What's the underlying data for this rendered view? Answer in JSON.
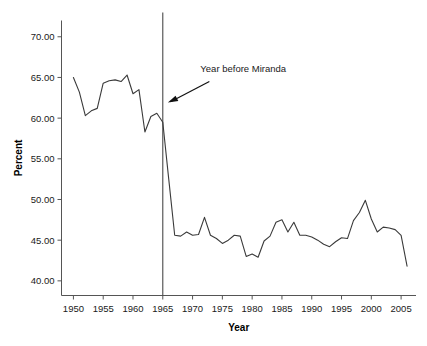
{
  "chart_data": {
    "type": "line",
    "title": "",
    "xlabel": "Year",
    "ylabel": "Percent",
    "xlim": [
      1948,
      2007.5
    ],
    "ylim": [
      38.2,
      72.0
    ],
    "grid": false,
    "legend": "none",
    "xticks": [
      1950,
      1955,
      1960,
      1965,
      1970,
      1975,
      1980,
      1985,
      1990,
      1995,
      2000,
      2005
    ],
    "xtick_labels": [
      "1950",
      "1955",
      "1960",
      "1965",
      "1970",
      "1975",
      "1980",
      "1985",
      "1990",
      "1995",
      "2000",
      "2005"
    ],
    "yticks": [
      40,
      45,
      50,
      55,
      60,
      65,
      70
    ],
    "ytick_labels": [
      "40.00",
      "45.00",
      "50.00",
      "55.00",
      "60.00",
      "65.00",
      "70.00"
    ],
    "x": [
      1950,
      1951,
      1952,
      1953,
      1954,
      1955,
      1956,
      1957,
      1958,
      1959,
      1960,
      1961,
      1962,
      1963,
      1964,
      1965,
      1966,
      1967,
      1968,
      1969,
      1970,
      1971,
      1972,
      1973,
      1974,
      1975,
      1976,
      1977,
      1978,
      1979,
      1980,
      1981,
      1982,
      1983,
      1984,
      1985,
      1986,
      1987,
      1988,
      1989,
      1990,
      1991,
      1992,
      1993,
      1994,
      1995,
      1996,
      1997,
      1998,
      1999,
      2000,
      2001,
      2002,
      2003,
      2004,
      2005,
      2006
    ],
    "values": [
      65.0,
      63.2,
      60.3,
      60.9,
      61.2,
      64.3,
      64.6,
      64.7,
      64.5,
      65.3,
      63.0,
      63.5,
      58.3,
      60.2,
      60.6,
      59.5,
      52.5,
      45.6,
      45.5,
      46.0,
      45.6,
      45.7,
      47.8,
      45.6,
      45.2,
      44.6,
      45.0,
      45.6,
      45.5,
      43.0,
      43.3,
      42.9,
      44.9,
      45.5,
      47.2,
      47.5,
      46.0,
      47.2,
      45.6,
      45.6,
      45.4,
      45.0,
      44.5,
      44.2,
      44.8,
      45.3,
      45.2,
      47.4,
      48.4,
      49.9,
      47.6,
      46.0,
      46.6,
      46.5,
      46.3,
      45.6,
      41.8
    ],
    "series_name": "Percent",
    "reference_line": {
      "x": 1965,
      "label": "Year before Miranda",
      "orientation": "vertical"
    },
    "annotation": {
      "text": "Year before Miranda",
      "points_to_x": 1965.6,
      "points_to_y": 61.8
    }
  },
  "axis": {
    "x_title": "Year",
    "y_title": "Percent"
  },
  "annotation_label": "Year before Miranda"
}
